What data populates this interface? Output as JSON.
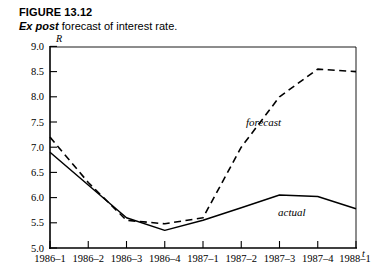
{
  "figure": {
    "number": "FIGURE 13.12",
    "title_italic": "Ex post",
    "title_rest": " forecast of interest rate."
  },
  "chart_data": {
    "type": "line",
    "title": "Ex post forecast of interest rate.",
    "xlabel": "t",
    "ylabel": "R",
    "ylim": [
      5.0,
      9.0
    ],
    "ytick_step": 0.5,
    "grid": false,
    "legend": "inline-annotations",
    "categories": [
      "1986–1",
      "1986–2",
      "1986–3",
      "1986–4",
      "1987–1",
      "1987–2",
      "1987–3",
      "1987–4",
      "1988–1"
    ],
    "yticks": [
      "5.0",
      "5.5",
      "6.0",
      "6.5",
      "7.0",
      "7.5",
      "8.0",
      "8.5",
      "9.0"
    ],
    "ytick_values": [
      5.0,
      5.5,
      6.0,
      6.5,
      7.0,
      7.5,
      8.0,
      8.5,
      9.0
    ],
    "series": [
      {
        "name": "forecast",
        "style": "dashed",
        "label_x_category": "1987–2",
        "values": [
          7.2,
          6.3,
          5.55,
          5.48,
          5.6,
          7.0,
          8.0,
          8.55,
          8.5
        ]
      },
      {
        "name": "actual",
        "style": "solid",
        "label_x_category": "1987–3",
        "values": [
          6.9,
          6.25,
          5.6,
          5.35,
          5.55,
          5.8,
          6.05,
          6.02,
          5.78
        ]
      }
    ],
    "annotations": [
      {
        "text": "forecast",
        "x": 246,
        "y": 96
      },
      {
        "text": "actual",
        "x": 278,
        "y": 186
      }
    ]
  },
  "colors": {
    "ink": "#000000",
    "background": "#ffffff"
  }
}
